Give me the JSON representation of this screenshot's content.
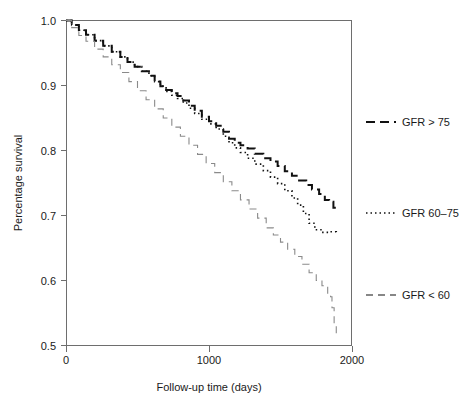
{
  "chart_data": {
    "type": "line",
    "title": "",
    "subtitle": "",
    "xlabel": "Follow-up time (days)",
    "ylabel": "Percentage survival",
    "xlim": [
      0,
      2000
    ],
    "ylim": [
      0.5,
      1.0
    ],
    "xticks": [
      0,
      1000,
      2000
    ],
    "xtick_labels": [
      "0",
      "1000",
      "2000"
    ],
    "yticks": [
      0.5,
      0.6,
      0.7,
      0.8,
      0.9,
      1.0
    ],
    "ytick_labels": [
      "0.5",
      "0.6",
      "0.7",
      "0.8",
      "0.9",
      "1.0"
    ],
    "grid": false,
    "legend_position": "right",
    "annotations": [],
    "series": [
      {
        "name": "GFR > 75",
        "style": "dashed",
        "color": "#111111",
        "width": 2.0,
        "dash": "9,5",
        "x": [
          0,
          40,
          90,
          140,
          200,
          260,
          320,
          380,
          430,
          480,
          530,
          580,
          620,
          660,
          700,
          740,
          780,
          820,
          860,
          900,
          950,
          1000,
          1050,
          1100,
          1140,
          1180,
          1220,
          1270,
          1320,
          1380,
          1430,
          1480,
          1530,
          1580,
          1630,
          1680,
          1720,
          1770,
          1810,
          1840,
          1870,
          1890
        ],
        "y": [
          1.0,
          0.993,
          0.985,
          0.978,
          0.969,
          0.961,
          0.952,
          0.944,
          0.936,
          0.929,
          0.922,
          0.915,
          0.906,
          0.899,
          0.893,
          0.888,
          0.884,
          0.877,
          0.869,
          0.861,
          0.852,
          0.845,
          0.838,
          0.829,
          0.818,
          0.812,
          0.808,
          0.803,
          0.795,
          0.788,
          0.783,
          0.776,
          0.768,
          0.761,
          0.754,
          0.747,
          0.74,
          0.733,
          0.724,
          0.721,
          0.712,
          0.711
        ]
      },
      {
        "name": "GFR 60-75",
        "label": "GFR 60–75",
        "style": "dotted",
        "color": "#111111",
        "width": 1.6,
        "dash": "1.5,3",
        "x": [
          0,
          40,
          90,
          140,
          200,
          260,
          320,
          380,
          430,
          480,
          530,
          580,
          620,
          660,
          700,
          740,
          780,
          820,
          860,
          900,
          950,
          1000,
          1050,
          1100,
          1140,
          1180,
          1220,
          1270,
          1320,
          1380,
          1430,
          1480,
          1530,
          1580,
          1620,
          1660,
          1700,
          1740,
          1790,
          1840,
          1870,
          1890
        ],
        "y": [
          1.0,
          0.993,
          0.985,
          0.978,
          0.969,
          0.961,
          0.952,
          0.944,
          0.936,
          0.929,
          0.922,
          0.915,
          0.906,
          0.899,
          0.891,
          0.885,
          0.88,
          0.873,
          0.865,
          0.857,
          0.848,
          0.841,
          0.833,
          0.822,
          0.812,
          0.804,
          0.797,
          0.788,
          0.779,
          0.769,
          0.759,
          0.749,
          0.738,
          0.727,
          0.716,
          0.703,
          0.688,
          0.678,
          0.674,
          0.675,
          0.675,
          0.674
        ]
      },
      {
        "name": "GFR < 60",
        "style": "dashed-thin",
        "color": "#8a8a8a",
        "width": 1.1,
        "dash": "7,5",
        "x": [
          0,
          40,
          90,
          140,
          200,
          260,
          320,
          380,
          440,
          500,
          560,
          620,
          680,
          740,
          800,
          860,
          920,
          980,
          1040,
          1100,
          1160,
          1220,
          1280,
          1340,
          1400,
          1450,
          1500,
          1550,
          1600,
          1650,
          1700,
          1750,
          1790,
          1830,
          1845,
          1850,
          1860,
          1875,
          1890
        ],
        "y": [
          1.0,
          0.989,
          0.977,
          0.968,
          0.956,
          0.944,
          0.932,
          0.92,
          0.906,
          0.892,
          0.878,
          0.864,
          0.85,
          0.836,
          0.822,
          0.808,
          0.794,
          0.78,
          0.766,
          0.752,
          0.738,
          0.724,
          0.71,
          0.696,
          0.681,
          0.67,
          0.659,
          0.648,
          0.637,
          0.625,
          0.612,
          0.6,
          0.592,
          0.578,
          0.576,
          0.575,
          0.558,
          0.532,
          0.518
        ]
      }
    ]
  },
  "legend": {
    "entries": [
      {
        "label": "GFR > 75",
        "style": "dashed",
        "color": "#111111"
      },
      {
        "label": "GFR 60–75",
        "style": "dotted",
        "color": "#111111"
      },
      {
        "label": "GFR < 60",
        "style": "dashed-thin",
        "color": "#111111"
      }
    ]
  }
}
